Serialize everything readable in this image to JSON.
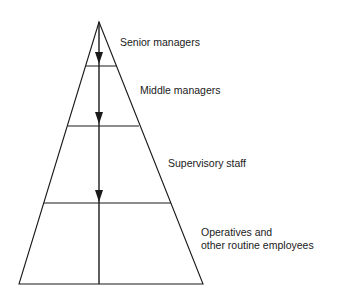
{
  "diagram": {
    "type": "organisational-pyramid",
    "levels": [
      {
        "label": "Senior managers"
      },
      {
        "label": "Middle managers"
      },
      {
        "label": "Supervisory staff"
      },
      {
        "label_line1": "Operatives and",
        "label_line2": "other routine employees"
      }
    ],
    "arrow_direction": "top-to-bottom",
    "line_color": "#1a1a1a"
  }
}
